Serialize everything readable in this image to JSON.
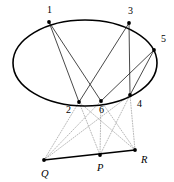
{
  "figure": {
    "background_color": "#ffffff",
    "stroke_color": "#000000",
    "dotted_color": "#9a9a9a",
    "width": 174,
    "height": 182
  },
  "conic": {
    "type": "ellipse",
    "cx": 85,
    "cy": 63,
    "rx": 72,
    "ry": 43
  },
  "vertices": [
    {
      "label": "1",
      "x": 49,
      "y": 22,
      "lx": 47,
      "ly": 13,
      "italic": false
    },
    {
      "label": "2",
      "x": 79,
      "y": 102,
      "lx": 66,
      "ly": 113,
      "italic": false
    },
    {
      "label": "3",
      "x": 129,
      "y": 23,
      "lx": 128,
      "ly": 14,
      "italic": false
    },
    {
      "label": "4",
      "x": 130,
      "y": 95,
      "lx": 137,
      "ly": 107,
      "italic": false
    },
    {
      "label": "5",
      "x": 154,
      "y": 50,
      "lx": 161,
      "ly": 42,
      "italic": false
    },
    {
      "label": "6",
      "x": 101,
      "y": 101,
      "lx": 99,
      "ly": 113,
      "italic": false
    }
  ],
  "pascal_points": [
    {
      "label": "Q",
      "x": 44,
      "y": 160,
      "lx": 41,
      "ly": 177,
      "italic": true
    },
    {
      "label": "P",
      "x": 100,
      "y": 155,
      "lx": 97,
      "ly": 171,
      "italic": true
    },
    {
      "label": "R",
      "x": 135,
      "y": 150,
      "lx": 141,
      "ly": 163,
      "italic": true
    }
  ],
  "chords": [
    {
      "name": "chord-1-2",
      "from": "1",
      "to": "2"
    },
    {
      "name": "chord-1-6",
      "from": "1",
      "to": "6"
    },
    {
      "name": "chord-3-2",
      "from": "3",
      "to": "2"
    },
    {
      "name": "chord-3-4",
      "from": "3",
      "to": "4"
    },
    {
      "name": "chord-5-4",
      "from": "5",
      "to": "4"
    },
    {
      "name": "chord-5-6",
      "from": "5",
      "to": "6"
    }
  ],
  "projections": [
    {
      "name": "dotted-q-2",
      "from": "Q",
      "to": "2"
    },
    {
      "name": "dotted-q-6",
      "from": "Q",
      "to": "6"
    },
    {
      "name": "dotted-q-4",
      "from": "Q",
      "to": "4"
    },
    {
      "name": "dotted-p-2",
      "from": "P",
      "to": "2"
    },
    {
      "name": "dotted-p-6",
      "from": "P",
      "to": "6"
    },
    {
      "name": "dotted-p-4",
      "from": "P",
      "to": "4"
    },
    {
      "name": "dotted-r-2",
      "from": "R",
      "to": "2"
    },
    {
      "name": "dotted-r-6",
      "from": "R",
      "to": "6"
    },
    {
      "name": "dotted-r-4",
      "from": "R",
      "to": "4"
    }
  ],
  "pascal_line": {
    "name": "pascal-line",
    "from": "Q",
    "to": "R"
  }
}
